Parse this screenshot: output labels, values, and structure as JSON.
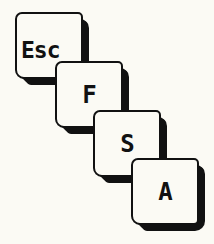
{
  "keys": [
    {
      "label": "Esc"
    },
    {
      "label": "F"
    },
    {
      "label": "S"
    },
    {
      "label": "A"
    }
  ],
  "colors": {
    "ink": "#111111",
    "paper": "#fbfaf4"
  }
}
